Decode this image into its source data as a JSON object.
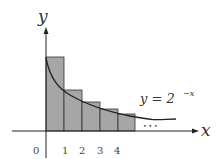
{
  "diagram": {
    "title": "",
    "axes": {
      "x_label": "x",
      "y_label": "y",
      "origin_label": "0",
      "ticks": [
        "1",
        "2",
        "3",
        "4"
      ]
    },
    "curve": {
      "label_prefix": "y = 2",
      "label_exponent": "−x",
      "function": "y = 2^{-x}"
    },
    "ellipsis": "• • •",
    "bars": [
      {
        "from": 0,
        "to": 1,
        "height": 1
      },
      {
        "from": 1,
        "to": 2,
        "height": 0.5
      },
      {
        "from": 2,
        "to": 3,
        "height": 0.25
      },
      {
        "from": 3,
        "to": 4,
        "height": 0.125
      },
      {
        "from": 4,
        "to": 5,
        "height": 0.0625
      }
    ],
    "colors": {
      "bar_fill": "#a6a6a6",
      "bar_stroke": "#333333",
      "axis": "#222222",
      "curve": "#222222"
    }
  }
}
